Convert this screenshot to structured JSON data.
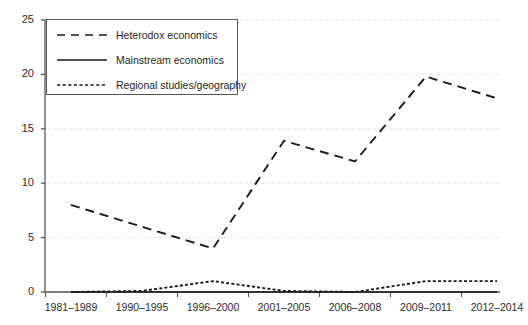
{
  "chart_data": {
    "type": "line",
    "title": "",
    "xlabel": "",
    "ylabel": "",
    "categories": [
      "1981–1989",
      "1990–1995",
      "1996–2000",
      "2001–2005",
      "2006–2008",
      "2009–2011",
      "2012–2014"
    ],
    "ylim": [
      0,
      25
    ],
    "yticks": [
      0,
      5,
      10,
      15,
      20,
      25
    ],
    "grid": true,
    "grid_style": "dotted-horizontal",
    "legend_position": "top-left",
    "series": [
      {
        "name": "Heterodox economics",
        "style": "dashed",
        "color": "#1a1a1a",
        "values": [
          8,
          6,
          4,
          13.9,
          12,
          19.8,
          17.8
        ]
      },
      {
        "name": "Mainstream economics",
        "style": "solid",
        "color": "#1a1a1a",
        "values": [
          0,
          0,
          0,
          0,
          0,
          0,
          0
        ]
      },
      {
        "name": "Regional studies/geography",
        "style": "dotted",
        "color": "#1a1a1a",
        "values": [
          0,
          0.1,
          1,
          0.1,
          0,
          1,
          1
        ]
      }
    ]
  },
  "axes": {
    "y_tick_labels": [
      "25",
      "20",
      "15",
      "10",
      "5",
      "0"
    ],
    "x_tick_labels": [
      "1981–1989",
      "1990–1995",
      "1996–2000",
      "2001–2005",
      "2006–2008",
      "2009–2011",
      "2012–2014"
    ]
  },
  "legend": {
    "items": [
      {
        "label": "Heterodox economics",
        "style": "dashed"
      },
      {
        "label": "Mainstream economics",
        "style": "solid"
      },
      {
        "label": "Regional studies/geography",
        "style": "dotted"
      }
    ]
  },
  "colors": {
    "line": "#1a1a1a",
    "axis": "#555555",
    "grid": "#c8c8c8",
    "text": "#2b2b2b",
    "background": "#ffffff"
  }
}
